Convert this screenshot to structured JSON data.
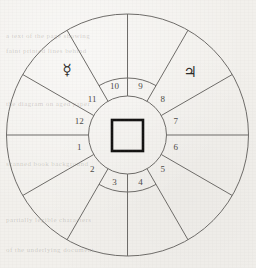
{
  "chart": {
    "type": "house-wheel",
    "geometry": {
      "center_x": 127.5,
      "center_y": 135,
      "outer_radius": 121,
      "mid_radius": 57,
      "inner_radius": 39,
      "spoke_count": 12
    },
    "colors": {
      "background": "#f2f0ec",
      "line": "#6d6b68",
      "text": "#4c4a47",
      "glyph": "#2b2a28",
      "center_square": "#131211"
    },
    "houses": [
      {
        "number": "1",
        "angle_deg": 195
      },
      {
        "number": "2",
        "angle_deg": 225
      },
      {
        "number": "3",
        "angle_deg": 255
      },
      {
        "number": "4",
        "angle_deg": 285
      },
      {
        "number": "5",
        "angle_deg": 315
      },
      {
        "number": "6",
        "angle_deg": 345
      },
      {
        "number": "7",
        "angle_deg": 15
      },
      {
        "number": "8",
        "angle_deg": 45
      },
      {
        "number": "9",
        "angle_deg": 75
      },
      {
        "number": "10",
        "angle_deg": 105
      },
      {
        "number": "11",
        "angle_deg": 135
      },
      {
        "number": "12",
        "angle_deg": 165
      }
    ],
    "planets": [
      {
        "name": "mercury",
        "glyph": "☿",
        "label": "Mercury",
        "x": 67,
        "y": 70
      },
      {
        "name": "jupiter",
        "glyph": "♃",
        "label": "Jupiter",
        "x": 190,
        "y": 72
      }
    ],
    "center_marker": {
      "name": "square-aspect-marker",
      "shape": "square",
      "x": 112,
      "y": 120,
      "size": 31
    }
  },
  "chart_data": {
    "type": "pie",
    "xlabel": "",
    "ylabel": "",
    "categories": [
      "1",
      "2",
      "3",
      "4",
      "5",
      "6",
      "7",
      "8",
      "9",
      "10",
      "11",
      "12"
    ],
    "values": [
      30,
      30,
      30,
      30,
      30,
      30,
      30,
      30,
      30,
      30,
      30,
      30
    ],
    "annotations": [
      "☿ Mercury",
      "♃ Jupiter",
      "□ center square"
    ],
    "legend_position": "none",
    "grid": false
  },
  "background_text": {
    "lines": [
      "a text of the page showing",
      "faint printed lines behind",
      "the diagram on aged paper",
      "scanned book background",
      "partially legible characters",
      "of the underlying document"
    ]
  }
}
